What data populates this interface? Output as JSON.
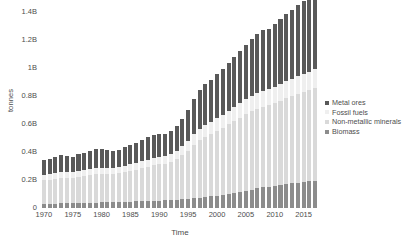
{
  "chart_data": {
    "type": "bar",
    "stacked": true,
    "title": "",
    "xlabel": "Time",
    "ylabel": "tonnes",
    "grid": false,
    "legend_position": "right",
    "ylim": [
      0,
      1400000000
    ],
    "ytick_labels": [
      "0",
      "0.2B",
      "0.4B",
      "0.6B",
      "0.8B",
      "1B",
      "1.2B",
      "1.4B"
    ],
    "ytick_values": [
      0,
      200000000,
      400000000,
      600000000,
      800000000,
      1000000000,
      1200000000,
      1400000000
    ],
    "xtick_labels": [
      "1970",
      "1975",
      "1980",
      "1985",
      "1990",
      "1995",
      "2000",
      "2005",
      "2010",
      "2015"
    ],
    "xtick_values": [
      1970,
      1975,
      1980,
      1985,
      1990,
      1995,
      2000,
      2005,
      2010,
      2015
    ],
    "x": [
      1970,
      1971,
      1972,
      1973,
      1974,
      1975,
      1976,
      1977,
      1978,
      1979,
      1980,
      1981,
      1982,
      1983,
      1984,
      1985,
      1986,
      1987,
      1988,
      1989,
      1990,
      1991,
      1992,
      1993,
      1994,
      1995,
      1996,
      1997,
      1998,
      1999,
      2000,
      2001,
      2002,
      2003,
      2004,
      2005,
      2006,
      2007,
      2008,
      2009,
      2010,
      2011,
      2012,
      2013,
      2014,
      2015,
      2016,
      2017
    ],
    "series": [
      {
        "name": "Biomass",
        "color": "#8c8c8c",
        "values": [
          0.03,
          0.031,
          0.032,
          0.033,
          0.034,
          0.035,
          0.036,
          0.037,
          0.038,
          0.039,
          0.04,
          0.041,
          0.042,
          0.043,
          0.044,
          0.046,
          0.047,
          0.049,
          0.05,
          0.052,
          0.053,
          0.055,
          0.057,
          0.059,
          0.062,
          0.065,
          0.069,
          0.073,
          0.078,
          0.083,
          0.089,
          0.095,
          0.101,
          0.108,
          0.116,
          0.124,
          0.132,
          0.14,
          0.147,
          0.152,
          0.158,
          0.164,
          0.17,
          0.176,
          0.182,
          0.187,
          0.192,
          0.196
        ]
      },
      {
        "name": "Non-metallic minerals",
        "color": "#d9d9d9",
        "values": [
          0.168,
          0.172,
          0.178,
          0.185,
          0.182,
          0.18,
          0.188,
          0.192,
          0.198,
          0.203,
          0.204,
          0.202,
          0.2,
          0.205,
          0.212,
          0.219,
          0.226,
          0.234,
          0.244,
          0.252,
          0.258,
          0.262,
          0.272,
          0.29,
          0.315,
          0.345,
          0.382,
          0.412,
          0.432,
          0.447,
          0.462,
          0.478,
          0.496,
          0.512,
          0.528,
          0.545,
          0.558,
          0.57,
          0.578,
          0.584,
          0.592,
          0.604,
          0.614,
          0.624,
          0.634,
          0.642,
          0.652,
          0.664
        ]
      },
      {
        "name": "Fossil fuels",
        "color": "#efefef",
        "values": [
          0.036,
          0.037,
          0.038,
          0.04,
          0.039,
          0.039,
          0.041,
          0.042,
          0.043,
          0.044,
          0.044,
          0.043,
          0.042,
          0.043,
          0.045,
          0.047,
          0.048,
          0.05,
          0.052,
          0.053,
          0.054,
          0.055,
          0.057,
          0.06,
          0.064,
          0.069,
          0.076,
          0.081,
          0.085,
          0.088,
          0.091,
          0.094,
          0.098,
          0.101,
          0.104,
          0.107,
          0.11,
          0.112,
          0.114,
          0.115,
          0.117,
          0.119,
          0.121,
          0.123,
          0.125,
          0.126,
          0.128,
          0.13
        ]
      },
      {
        "name": "Metal ores",
        "color": "#595959",
        "values": [
          0.108,
          0.11,
          0.116,
          0.124,
          0.118,
          0.112,
          0.12,
          0.124,
          0.13,
          0.136,
          0.134,
          0.128,
          0.12,
          0.124,
          0.134,
          0.14,
          0.146,
          0.152,
          0.16,
          0.166,
          0.164,
          0.16,
          0.166,
          0.178,
          0.196,
          0.22,
          0.25,
          0.276,
          0.29,
          0.3,
          0.312,
          0.324,
          0.34,
          0.356,
          0.374,
          0.392,
          0.408,
          0.424,
          0.436,
          0.43,
          0.448,
          0.466,
          0.48,
          0.494,
          0.51,
          0.522,
          0.538,
          0.552
        ]
      }
    ]
  },
  "legend": {
    "items": [
      {
        "label": "Metal ores"
      },
      {
        "label": "Fossil fuels"
      },
      {
        "label": "Non-metallic minerals"
      },
      {
        "label": "Biomass"
      }
    ]
  }
}
